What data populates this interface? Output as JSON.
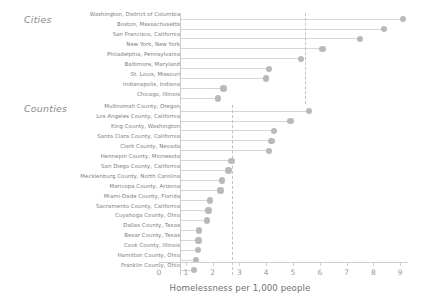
{
  "chart_data": {
    "type": "bar",
    "subtype": "lollipop-horizontal",
    "title": "",
    "xlabel": "Homelessness per 1,000 people",
    "ylabel": "",
    "xlim": [
      0,
      9.4
    ],
    "xticks": [
      0,
      1,
      2,
      3,
      4,
      5,
      6,
      7,
      8,
      9
    ],
    "xticklabels": [
      "0",
      "1",
      "2",
      "3",
      "4",
      "5",
      "6",
      "7",
      "8",
      "9"
    ],
    "grid": false,
    "legend": null,
    "groups": [
      {
        "name": "Cities",
        "reference_line": 5.45,
        "categories": [
          "Washington, District of Columbia",
          "Boston, Massachusetts",
          "San Francisco, California",
          "New York, New York",
          "Philadelphia, Pennsylvania",
          "Baltimore, Maryland",
          "St. Louis, Missouri",
          "Indianapolis, Indiana",
          "Chicago, Illinois"
        ],
        "values": [
          9.1,
          8.4,
          7.5,
          6.1,
          5.3,
          4.1,
          4.0,
          2.4,
          2.2
        ]
      },
      {
        "name": "Counties",
        "reference_line": 2.72,
        "categories": [
          "Multnomah County, Oregon",
          "Los Angeles County, California",
          "King County, Washington",
          "Santa Clara County, California",
          "Clark County, Nevada",
          "Hennepin County, Minnesota",
          "San Diego County, California",
          "Mecklenburg County, North Carolina",
          "Maricopa County, Arizona",
          "Miami-Dade County, Florida",
          "Sacramento County, California",
          "Cuyahoga County, Ohio",
          "Dallas County, Texas",
          "Bexar County, Texas",
          "Cook County, Illinois",
          "Hamilton County, Ohio",
          "Franklin County, Ohio"
        ],
        "values": [
          5.6,
          4.9,
          4.3,
          4.2,
          4.1,
          2.7,
          2.6,
          2.35,
          2.3,
          1.9,
          1.85,
          1.8,
          1.5,
          1.48,
          1.45,
          1.37,
          1.3
        ]
      }
    ],
    "colors": {
      "dot": "#b9b9b9",
      "stem": "#d6d6d6",
      "axis": "#cfcfcf",
      "reference_line": "#c2c2c2",
      "label_text": "#7d7d7d",
      "section_text": "#8c8c8c",
      "axis_title": "#6f6f6f"
    }
  },
  "labels": {
    "cities_header": "Cities",
    "counties_header": "Counties",
    "x_axis_title": "Homelessness per 1,000 people"
  }
}
